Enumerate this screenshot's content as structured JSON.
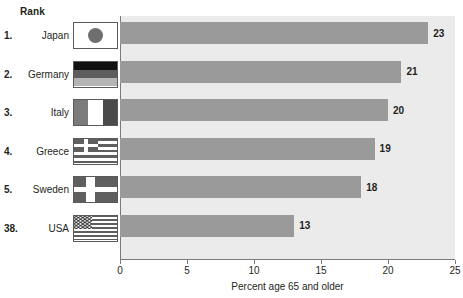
{
  "chart_data": {
    "type": "bar",
    "orientation": "horizontal",
    "title": "",
    "xlabel": "Percent age 65 and older",
    "ylabel": "",
    "xlim": [
      0,
      25
    ],
    "xticks": [
      0,
      5,
      10,
      15,
      20,
      25
    ],
    "xtick_labels": [
      "0",
      "5",
      "10",
      "15",
      "20",
      "25"
    ],
    "grid": false,
    "legend": "none",
    "categories": [
      "Japan",
      "Germany",
      "Italy",
      "Greece",
      "Sweden",
      "USA"
    ],
    "values": [
      23,
      21,
      20,
      19,
      18,
      13
    ],
    "value_labels": [
      "23",
      "21",
      "20",
      "19",
      "18",
      "13"
    ],
    "bar_color": "#9a9a9a",
    "plot_background": "#ebebeb"
  },
  "table": {
    "rank_header": "Rank",
    "rows": [
      {
        "rank": "1.",
        "country": "Japan",
        "value": 23,
        "value_label": "23",
        "flag": "flag-japan"
      },
      {
        "rank": "2.",
        "country": "Germany",
        "value": 21,
        "value_label": "21",
        "flag": "flag-germany"
      },
      {
        "rank": "3.",
        "country": "Italy",
        "value": 20,
        "value_label": "20",
        "flag": "flag-italy"
      },
      {
        "rank": "4.",
        "country": "Greece",
        "value": 19,
        "value_label": "19",
        "flag": "flag-greece"
      },
      {
        "rank": "5.",
        "country": "Sweden",
        "value": 18,
        "value_label": "18",
        "flag": "flag-sweden"
      },
      {
        "rank": "38.",
        "country": "USA",
        "value": 13,
        "value_label": "13",
        "flag": "flag-usa"
      }
    ]
  }
}
